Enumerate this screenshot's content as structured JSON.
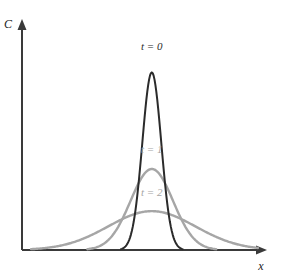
{
  "figure": {
    "background_color": "#ffffff",
    "axis_color": "#3a3a3a",
    "axes": {
      "y_label": "C",
      "x_label": "x",
      "y_label_name": "concentration",
      "x_label_name": "position"
    },
    "curve_labels": [
      {
        "text": "t = 0",
        "color": "#2b2b2b"
      },
      {
        "text": "t = 1",
        "color": "#a6a6a6"
      },
      {
        "text": "t = 2",
        "color": "#a6a6a6"
      }
    ]
  },
  "chart_data": {
    "type": "line",
    "title": "",
    "subtitle": "",
    "xlabel": "x",
    "ylabel": "C",
    "grid": false,
    "legend": "inline-annotations",
    "xlim": [
      0,
      1
    ],
    "ylim": [
      0,
      1
    ],
    "axis_ticks": {
      "x": [],
      "y": []
    },
    "series": [
      {
        "name": "t = 0",
        "label": "t = 0",
        "color": "#2b2b2b",
        "linewidth": 2.0,
        "peak_x": 0.55,
        "peak_y": 0.8,
        "sigma": 0.04,
        "annotation": {
          "text": "t = 0",
          "x": 0.55,
          "y": 0.9
        }
      },
      {
        "name": "t = 1",
        "label": "t = 1",
        "color": "#a6a6a6",
        "linewidth": 2.4,
        "peak_x": 0.55,
        "peak_y": 0.365,
        "sigma": 0.09,
        "annotation": {
          "text": "t = 1",
          "x": 0.55,
          "y": 0.435
        }
      },
      {
        "name": "t = 2",
        "label": "t = 2",
        "color": "#a6a6a6",
        "linewidth": 2.4,
        "peak_x": 0.55,
        "peak_y": 0.175,
        "sigma": 0.185,
        "annotation": {
          "text": "t = 2",
          "x": 0.55,
          "y": 0.245
        }
      }
    ]
  }
}
